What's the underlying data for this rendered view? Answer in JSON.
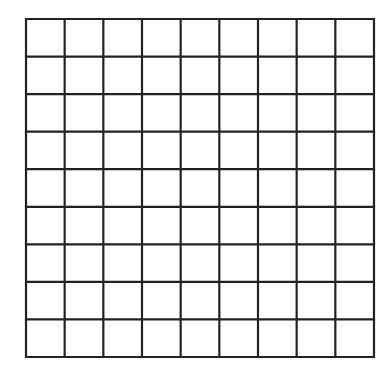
{
  "grid": {
    "rows": 9,
    "cols": 9,
    "left": 26,
    "top": 19,
    "right": 374,
    "bottom": 357,
    "line_color": "#222222",
    "line_width": 2.2,
    "background": "#ffffff"
  }
}
